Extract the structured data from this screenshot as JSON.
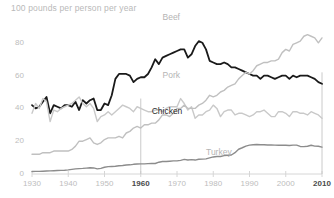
{
  "chart_data": {
    "type": "line",
    "title": "100 pounds per person per year",
    "xlabel": "",
    "ylabel": "pounds per person per year",
    "xlim": [
      1930,
      2010
    ],
    "ylim": [
      0,
      100
    ],
    "grid": false,
    "legend_position": "inline-labels",
    "yticks": [
      "0",
      "20",
      "40",
      "60",
      "80",
      "100"
    ],
    "ytick_values": [
      0,
      20,
      40,
      60,
      80,
      100
    ],
    "xticks": [
      "1930",
      "1940",
      "1950",
      "1960",
      "1970",
      "1980",
      "1990",
      "2000",
      "2010"
    ],
    "xtick_values": [
      1930,
      1940,
      1950,
      1960,
      1970,
      1980,
      1990,
      2000,
      2010
    ],
    "xticks_emphasized": [
      "1960",
      "2010"
    ],
    "annotations": [
      {
        "name": "marker-line-1960",
        "x": 1960,
        "y0": 0,
        "y1": 46
      },
      {
        "name": "marker-line-2010",
        "x": 2010,
        "y0": 0,
        "y1": 62
      }
    ],
    "x": [
      1930,
      1931,
      1932,
      1933,
      1934,
      1935,
      1936,
      1937,
      1938,
      1939,
      1940,
      1941,
      1942,
      1943,
      1944,
      1945,
      1946,
      1947,
      1948,
      1949,
      1950,
      1951,
      1952,
      1953,
      1954,
      1955,
      1956,
      1957,
      1958,
      1959,
      1960,
      1961,
      1962,
      1963,
      1964,
      1965,
      1966,
      1967,
      1968,
      1969,
      1970,
      1971,
      1972,
      1973,
      1974,
      1975,
      1976,
      1977,
      1978,
      1979,
      1980,
      1981,
      1982,
      1983,
      1984,
      1985,
      1986,
      1987,
      1988,
      1989,
      1990,
      1991,
      1992,
      1993,
      1994,
      1995,
      1996,
      1997,
      1998,
      1999,
      2000,
      2001,
      2002,
      2003,
      2004,
      2005,
      2006,
      2007,
      2008,
      2009,
      2010
    ],
    "series": [
      {
        "name": "Beef",
        "color": "#1a1a1a",
        "label_x": 1966,
        "label_y": 95,
        "values": [
          42,
          40,
          41,
          44,
          47,
          37,
          42,
          41,
          40,
          42,
          42,
          41,
          44,
          39,
          45,
          43,
          45,
          46,
          39,
          39,
          43,
          42,
          48,
          58,
          61,
          61,
          61,
          60,
          56,
          58,
          59,
          59,
          61,
          65,
          70,
          67,
          71,
          72,
          73,
          74,
          75,
          76,
          76,
          71,
          73,
          78,
          81,
          80,
          76,
          69,
          68,
          67,
          67,
          68,
          67,
          65,
          65,
          64,
          63,
          62,
          61,
          60,
          60,
          58,
          60,
          60,
          59,
          58,
          59,
          60,
          60,
          58,
          60,
          59,
          60,
          60,
          60,
          59,
          58,
          56,
          55
        ]
      },
      {
        "name": "Pork",
        "color": "#c9c9c9",
        "label_x": 1966,
        "label_y": 60,
        "values": [
          37,
          43,
          40,
          46,
          44,
          32,
          39,
          38,
          40,
          41,
          42,
          43,
          45,
          47,
          43,
          41,
          43,
          40,
          32,
          35,
          36,
          38,
          36,
          38,
          40,
          42,
          41,
          40,
          38,
          41,
          40,
          39,
          38,
          38,
          39,
          39,
          38,
          40,
          41,
          41,
          41,
          46,
          43,
          39,
          41,
          34,
          36,
          36,
          38,
          39,
          42,
          40,
          35,
          38,
          39,
          39,
          36,
          37,
          37,
          36,
          35,
          36,
          38,
          38,
          39,
          37,
          35,
          35,
          38,
          38,
          37,
          35,
          38,
          38,
          37,
          37,
          36,
          38,
          37,
          36,
          34
        ]
      },
      {
        "name": "Chicken",
        "color": "#c0c0c0",
        "label_x": 1963,
        "label_y": 38,
        "values": [
          12,
          12,
          12,
          13,
          13,
          13,
          14,
          14,
          14,
          14,
          14,
          15,
          17,
          20,
          20,
          21,
          22,
          19,
          18,
          19,
          21,
          22,
          22,
          22,
          23,
          22,
          25,
          26,
          28,
          29,
          28,
          30,
          30,
          31,
          31,
          33,
          36,
          36,
          35,
          37,
          40,
          40,
          42,
          40,
          40,
          40,
          42,
          43,
          45,
          48,
          47,
          48,
          50,
          51,
          53,
          54,
          55,
          58,
          60,
          62,
          61,
          63,
          66,
          67,
          68,
          68,
          69,
          69,
          70,
          74,
          76,
          75,
          79,
          80,
          81,
          84,
          85,
          84,
          83,
          80,
          83
        ]
      },
      {
        "name": "Turkey",
        "color": "#8c8c8c",
        "label_x": 1978,
        "label_y": 13,
        "values": [
          1.5,
          1.6,
          1.6,
          1.7,
          1.8,
          1.9,
          2.0,
          2.1,
          2.2,
          2.3,
          2.5,
          2.8,
          3.1,
          3.3,
          3.4,
          3.6,
          3.8,
          3.7,
          3.1,
          3.4,
          4.1,
          4.5,
          4.6,
          4.7,
          5.0,
          5.2,
          5.5,
          5.6,
          5.9,
          6.1,
          6.2,
          6.2,
          6.3,
          6.4,
          6.4,
          7.2,
          7.6,
          7.6,
          7.8,
          8.0,
          8.0,
          8.3,
          8.9,
          8.5,
          8.8,
          8.5,
          9.0,
          9.1,
          9.2,
          9.8,
          10.4,
          10.7,
          10.7,
          11.2,
          11.4,
          11.6,
          13.0,
          15.1,
          16.0,
          17.0,
          17.6,
          17.8,
          18.0,
          17.8,
          17.8,
          17.7,
          17.7,
          17.6,
          17.5,
          17.5,
          17.5,
          17.4,
          17.6,
          17.6,
          16.8,
          16.7,
          16.9,
          17.5,
          17.0,
          16.9,
          16.4
        ]
      }
    ]
  }
}
